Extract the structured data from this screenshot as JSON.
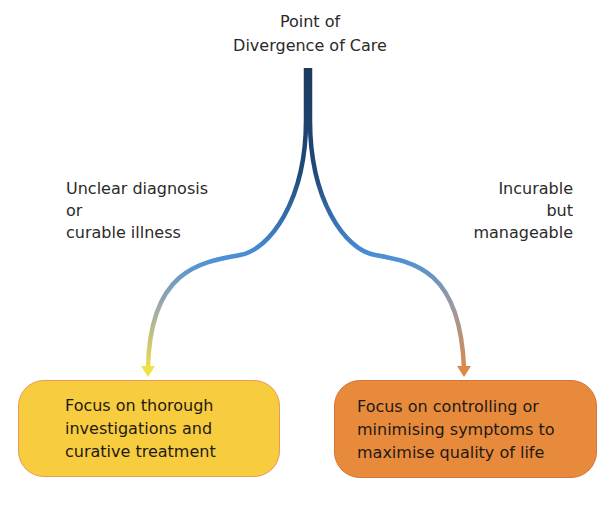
{
  "diagram": {
    "title": [
      "Point of",
      "Divergence of Care"
    ],
    "branches": [
      {
        "condition": [
          "Unclear diagnosis",
          "or",
          "curable illness"
        ],
        "outcome": [
          "Focus on thorough",
          "investigations and",
          "curative treatment"
        ],
        "color": "#f7cc3e"
      },
      {
        "condition": [
          "Incurable",
          "but",
          "manageable"
        ],
        "outcome": [
          "Focus on controlling or",
          "minimising symptoms to",
          "maximise quality of life"
        ],
        "color": "#e88a3c"
      }
    ],
    "colors": {
      "trunk": "#1c3a5e",
      "mid": "#4a8fd8",
      "left_end": "#f2e04a",
      "right_end": "#d9894a"
    }
  }
}
